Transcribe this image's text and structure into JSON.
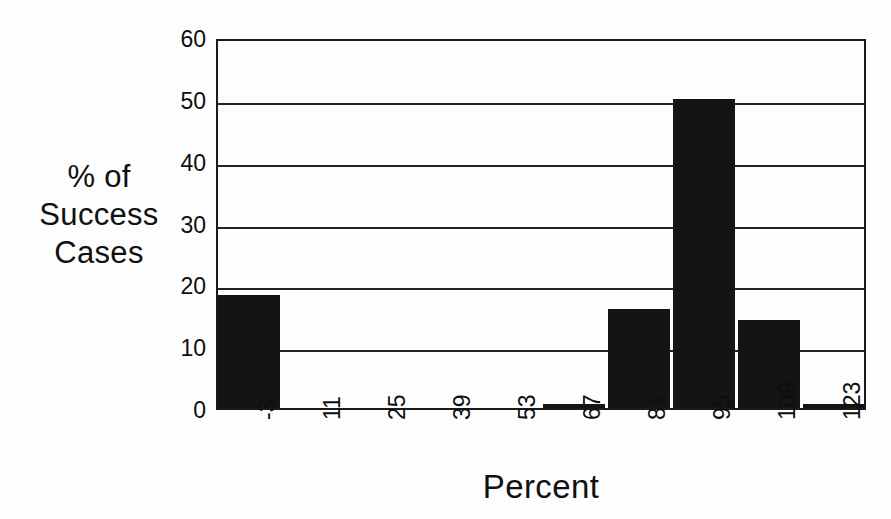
{
  "chart_data": {
    "type": "bar",
    "title": "",
    "xlabel": "Percent",
    "ylabel": "% of Success Cases",
    "ylabel_lines": [
      "% of",
      "Success",
      "Cases"
    ],
    "categories": [
      "-3",
      "11",
      "25",
      "39",
      "53",
      "67",
      "81",
      "95",
      "109",
      "123"
    ],
    "values": [
      18.3,
      0,
      0,
      0,
      0,
      0.5,
      16.0,
      50.0,
      14.3,
      0.5
    ],
    "ylim": [
      0,
      60
    ],
    "yticks": [
      0,
      10,
      20,
      30,
      40,
      50,
      60
    ],
    "ytick_labels": [
      "0",
      "10",
      "20",
      "30",
      "40",
      "50",
      "60"
    ],
    "grid": true,
    "grid_axis": "y",
    "legend": false,
    "legend_position": "none",
    "bar_color": "#141414",
    "axis_color": "#1b1b1b",
    "background_color": "#fdfdfd",
    "xtick_rotation": -90
  }
}
